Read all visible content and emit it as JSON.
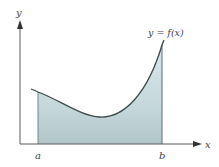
{
  "diagram": {
    "type": "area-under-curve",
    "colors": {
      "axis": "#5a5a5a",
      "curve": "#3d4a4a",
      "fill_top": "#d6e6ea",
      "fill_bottom": "#b4c8cc",
      "bound_line": "#5f6e6e",
      "label": "#444444"
    },
    "axes": {
      "x_label": "x",
      "y_label": "y"
    },
    "curve_label": "y = f(x)",
    "bounds": {
      "lower_label": "a",
      "upper_label": "b"
    }
  }
}
